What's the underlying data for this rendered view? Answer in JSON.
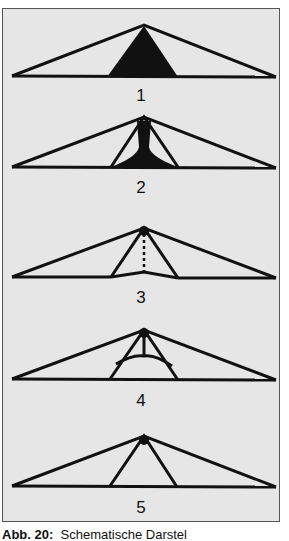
{
  "figure": {
    "panels": [
      {
        "label": "1",
        "description": "solid filled central triangle"
      },
      {
        "label": "2",
        "description": "filled central trunk with flared base inside inner triangle"
      },
      {
        "label": "3",
        "description": "apex dot with dotted vertical line, slight peaked base"
      },
      {
        "label": "4",
        "description": "apex dot with vertical line splitting into two curved arcs"
      },
      {
        "label": "5",
        "description": "apex dot with plain inner triangle"
      }
    ],
    "caption_bold": "Abb. 20",
    "caption_rest": "Schematische Darstel"
  },
  "colors": {
    "background": "#e6e6e6",
    "stroke": "#111111",
    "frame": "#555555"
  }
}
